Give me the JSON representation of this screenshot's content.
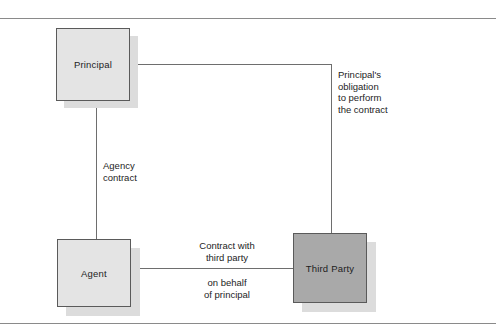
{
  "diagram": {
    "colors": {
      "node_light": "#e4e4e4",
      "node_dark": "#a9a9a9",
      "node_border": "#5a5a5a",
      "shadow": "#dcdcdc",
      "connector": "#6e6e6e",
      "rule": "#8a8a8a",
      "text": "#1d1d1d"
    },
    "nodes": [
      {
        "id": "principal",
        "label": "Principal"
      },
      {
        "id": "agent",
        "label": "Agent"
      },
      {
        "id": "third_party",
        "label": "Third Party"
      }
    ],
    "captions": [
      {
        "id": "principal_obligation",
        "text": "Principal's\nobligation\nto perform\nthe contract",
        "relates_to": "principal -> third_party"
      },
      {
        "id": "agency_contract",
        "text": "Agency\ncontract",
        "relates_to": "principal -> agent"
      },
      {
        "id": "contract_with_third_party",
        "text": "Contract with\nthird party",
        "relates_to": "agent -> third_party"
      },
      {
        "id": "on_behalf_of_principal",
        "text": "on behalf\nof principal",
        "relates_to": "agent -> third_party"
      }
    ],
    "connectors": [
      {
        "id": "principal-to-agent",
        "from": "principal",
        "to": "agent"
      },
      {
        "id": "principal-to-third-party",
        "from": "principal",
        "to": "third_party"
      },
      {
        "id": "agent-to-third-party",
        "from": "agent",
        "to": "third_party"
      }
    ]
  }
}
